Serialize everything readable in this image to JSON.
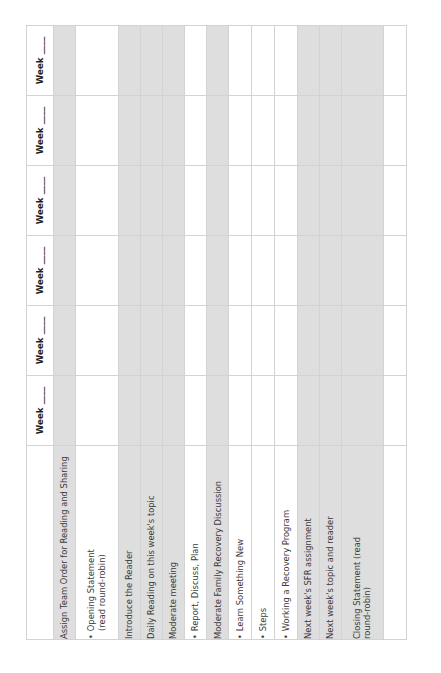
{
  "document": {
    "title": "Weekly Meeting Agenda Checklist",
    "orientation": "rotated-90-ccw",
    "colors": {
      "band_shade": "#dedede",
      "grid_line": "#d3d3d3",
      "text": "#3a3a3a",
      "header_text": "#1d1d1d",
      "page_background": "#ffffff"
    }
  },
  "table": {
    "week_column_count": 6,
    "week_headers": [
      {
        "label": "Week ____"
      },
      {
        "label": "Week ____"
      },
      {
        "label": "Week ____"
      },
      {
        "label": "Week ____"
      },
      {
        "label": "Week ____"
      },
      {
        "label": "Week ____"
      }
    ],
    "rows": [
      {
        "id": "assign-team-order",
        "shaded": true,
        "bulleted": false,
        "lines": [
          "Assign Team Order for Reading and Sharing"
        ]
      },
      {
        "id": "opening-statement",
        "shaded": false,
        "bulleted": true,
        "lines": [
          "Opening Statement",
          "(read round-robin)"
        ]
      },
      {
        "id": "introduce-the-reader",
        "shaded": true,
        "bulleted": false,
        "lines": [
          "Introduce the Reader"
        ]
      },
      {
        "id": "daily-reading",
        "shaded": true,
        "bulleted": false,
        "lines": [
          "Daily Reading on this week's topic"
        ]
      },
      {
        "id": "moderate-meeting",
        "shaded": true,
        "bulleted": false,
        "lines": [
          "Moderate meeting"
        ]
      },
      {
        "id": "report-discuss-plan",
        "shaded": false,
        "bulleted": true,
        "lines": [
          "Report, Discuss, Plan"
        ]
      },
      {
        "id": "moderate-family-recovery-discussion",
        "shaded": true,
        "bulleted": false,
        "lines": [
          "Moderate Family Recovery Discussion"
        ]
      },
      {
        "id": "learn-something-new",
        "shaded": false,
        "bulleted": true,
        "lines": [
          "Learn Something New"
        ]
      },
      {
        "id": "steps",
        "shaded": false,
        "bulleted": true,
        "lines": [
          "Steps"
        ]
      },
      {
        "id": "working-a-recovery-program",
        "shaded": false,
        "bulleted": true,
        "lines": [
          "Working a Recovery Program"
        ]
      },
      {
        "id": "next-week-sfr-assignment",
        "shaded": true,
        "bulleted": false,
        "lines": [
          "Next week's SFR assignment"
        ]
      },
      {
        "id": "next-week-topic-and-reader",
        "shaded": true,
        "bulleted": false,
        "lines": [
          "Next week's topic and reader"
        ]
      },
      {
        "id": "closing-statement",
        "shaded": true,
        "bulleted": false,
        "lines": [
          "Closing Statement (read",
          "round-robin)"
        ]
      },
      {
        "id": "blank-row",
        "shaded": false,
        "bulleted": false,
        "lines": [
          ""
        ]
      }
    ]
  }
}
